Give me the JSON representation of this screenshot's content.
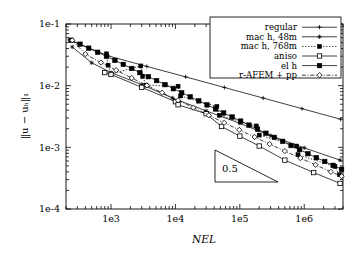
{
  "chart_data": {
    "type": "line",
    "title": "",
    "xlabel": "NEL",
    "ylabel": "||u - u_h||_1",
    "xscale": "log",
    "yscale": "log",
    "xlim": [
      200,
      4000000
    ],
    "ylim": [
      0.0001,
      0.1
    ],
    "xticks": [
      "1e3",
      "1e4",
      "1e5",
      "1e6"
    ],
    "xtick_values": [
      1000,
      10000,
      100000,
      1000000
    ],
    "yticks": [
      "1e-1",
      "1e-2",
      "1e-3",
      "1e-4"
    ],
    "ytick_values": [
      0.1,
      0.01,
      0.001,
      0.0001
    ],
    "grid": false,
    "legend_position": "top-right",
    "annotations": [
      {
        "label": "0.5",
        "type": "slope-triangle",
        "slope": 0.5
      }
    ],
    "series": [
      {
        "name": "regular",
        "marker": "plus",
        "linestyle": "solid",
        "x": [
          225,
          900,
          3600,
          14400,
          57600,
          230400,
          921600,
          3686400
        ],
        "y": [
          0.0552,
          0.0305,
          0.0205,
          0.0139,
          0.00935,
          0.0063,
          0.00424,
          0.00285
        ]
      },
      {
        "name": "mac h, 48m",
        "marker": "star",
        "linestyle": "solid",
        "x": [
          250,
          500,
          1000,
          3000,
          9000,
          30000,
          100000,
          300000,
          1000000,
          3600000
        ],
        "y": [
          0.0425,
          0.0235,
          0.0163,
          0.0104,
          0.0063,
          0.0039,
          0.00245,
          0.00155,
          0.00098,
          0.00062
        ]
      },
      {
        "name": "mac h, 768m",
        "marker": "filled-square-small",
        "linestyle": "dotted",
        "x": [
          850,
          900,
          1000,
          2900,
          3100,
          3500,
          11000,
          12000,
          44000,
          48000,
          180000,
          200000,
          760000,
          800000,
          3000000,
          3500000
        ],
        "y": [
          0.0328,
          0.0215,
          0.0155,
          0.0209,
          0.0141,
          0.0102,
          0.0098,
          0.0068,
          0.0046,
          0.0033,
          0.00222,
          0.00158,
          0.00105,
          0.00076,
          0.00049,
          0.00036
        ]
      },
      {
        "name": "aniso",
        "marker": "open-square",
        "linestyle": "solid",
        "x": [
          800,
          1000,
          3000,
          10000,
          11000,
          30000,
          52000,
          100000,
          200000,
          500000,
          1400000,
          3600000
        ],
        "y": [
          0.0163,
          0.0152,
          0.0094,
          0.0055,
          0.0049,
          0.0035,
          0.00218,
          0.00152,
          0.00105,
          0.00062,
          0.00039,
          0.00026
        ]
      },
      {
        "name": "el h",
        "marker": "filled-square",
        "linestyle": "solid",
        "x": [
          240,
          330,
          450,
          620,
          850,
          1150,
          1550,
          2100,
          2800,
          3800,
          5100,
          6900,
          9300,
          12500,
          17000,
          23000,
          31000,
          42000,
          56000,
          76000,
          103000,
          139000,
          188000,
          254000,
          343000,
          463000,
          625000,
          845000,
          1140000,
          1540000,
          2080000,
          2810000,
          3800000
        ],
        "y": [
          0.0545,
          0.047,
          0.0405,
          0.0348,
          0.0299,
          0.0257,
          0.0221,
          0.019,
          0.0163,
          0.014,
          0.0121,
          0.0104,
          0.00893,
          0.00768,
          0.0066,
          0.00567,
          0.00488,
          0.00419,
          0.0036,
          0.0031,
          0.00266,
          0.00229,
          0.00197,
          0.00169,
          0.00145,
          0.00125,
          0.00107,
          0.00092,
          0.00079,
          0.00068,
          0.00059,
          0.00051,
          0.00044
        ]
      },
      {
        "name": "r-AFEM + pp",
        "marker": "open-diamond",
        "linestyle": "dash-dot",
        "x": [
          250,
          400,
          700,
          1200,
          2100,
          3600,
          6200,
          11000,
          19000,
          33000,
          57000,
          98000,
          170000,
          290000,
          500000,
          870000,
          1500000,
          2600000,
          3800000
        ],
        "y": [
          0.0545,
          0.0325,
          0.0237,
          0.0178,
          0.0133,
          0.0101,
          0.0077,
          0.0058,
          0.0044,
          0.0033,
          0.0025,
          0.00192,
          0.00147,
          0.00113,
          0.00087,
          0.00067,
          0.00052,
          0.0004,
          0.00034
        ]
      }
    ]
  },
  "legend": {
    "entries": [
      {
        "label": "regular"
      },
      {
        "label": "mac h, 48m"
      },
      {
        "label": "mac h, 768m"
      },
      {
        "label": "aniso"
      },
      {
        "label": "el h"
      },
      {
        "label": "r-AFEM + pp"
      }
    ]
  },
  "colors": {
    "axis": "#000000",
    "background": "#ffffff",
    "series": "#000000"
  }
}
